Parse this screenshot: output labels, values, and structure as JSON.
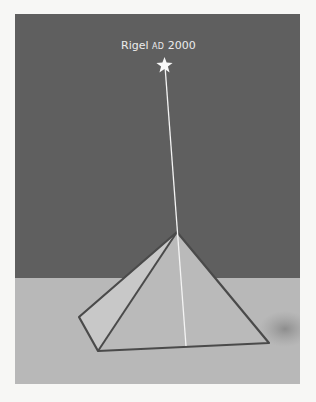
{
  "figure": {
    "star_label": {
      "name": "Rigel",
      "era": "AD",
      "year": "2000"
    },
    "colors": {
      "sky": "#5f5f5f",
      "ground": "#b8b8b8",
      "pyramid_face_front": "#bdbdbd",
      "pyramid_face_left": "#c6c6c6",
      "pyramid_edge": "#4a4a4a",
      "sight_line": "#f4f4f4",
      "star": "#f8f8f8",
      "background": "#f7f7f5"
    },
    "elements": [
      "star",
      "sight-line",
      "pyramid",
      "ground",
      "sky"
    ]
  }
}
